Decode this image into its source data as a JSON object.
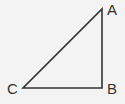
{
  "diagram": {
    "type": "right-triangle",
    "background": "#f3f3f3",
    "stroke_color": "#333333",
    "vertices": [
      {
        "label": "A",
        "x": 102,
        "y": 9
      },
      {
        "label": "B",
        "x": 102,
        "y": 88
      },
      {
        "label": "C",
        "x": 23,
        "y": 88
      }
    ],
    "edges": [
      {
        "from": "A",
        "to": "B"
      },
      {
        "from": "B",
        "to": "C"
      },
      {
        "from": "C",
        "to": "A"
      }
    ],
    "right_angle_at": "B"
  }
}
